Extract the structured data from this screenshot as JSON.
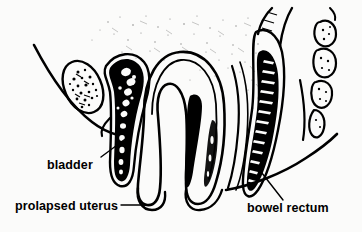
{
  "figure": {
    "kind": "medical-line-illustration",
    "background_color": "#fbfbfa",
    "ink_color": "#000000"
  },
  "labels": [
    {
      "id": "bladder",
      "text": "bladder",
      "x": 47,
      "y": 169,
      "leader": "M 101 157 L 128 137"
    },
    {
      "id": "prolapsed-uterus",
      "text": "prolapsed uterus",
      "x": 15,
      "y": 210,
      "leader": "M 121 205 L 150 205"
    },
    {
      "id": "bowel-rectum",
      "text": "bowel rectum",
      "x": 247,
      "y": 212,
      "leader": "M 283 200 L 258 168"
    }
  ],
  "structures": [
    {
      "id": "pubic-bone",
      "name": "pubic bone",
      "style": "stippled trabecular oval"
    },
    {
      "id": "bladder-organ",
      "name": "bladder",
      "style": "dark mottled elongated sac"
    },
    {
      "id": "prolapsed-uterus-organ",
      "name": "prolapsed uterus",
      "style": "inverted U outline with dark cervical canal"
    },
    {
      "id": "rectum-organ",
      "name": "bowel rectum",
      "style": "dark elongated tube with white striations"
    },
    {
      "id": "coccyx",
      "name": "coccyx",
      "style": "segmented vertebral bones"
    },
    {
      "id": "body-contour-left",
      "name": "left body contour",
      "style": "smooth curve"
    },
    {
      "id": "body-contour-right",
      "name": "right body contour",
      "style": "smooth curve"
    },
    {
      "id": "tissue-stipple",
      "name": "soft tissue shading",
      "style": "light stipple texture"
    }
  ]
}
